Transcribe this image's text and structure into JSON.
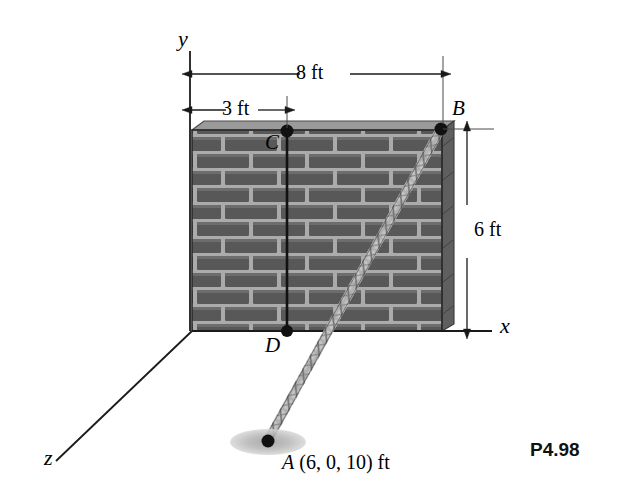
{
  "figure": {
    "problem_label": "P4.98",
    "axes": [
      {
        "name": "y-axis",
        "label": "y"
      },
      {
        "name": "x-axis",
        "label": "x"
      },
      {
        "name": "z-axis",
        "label": "z"
      }
    ],
    "points": [
      {
        "id": "B",
        "label": "B",
        "description": "cable anchor at top right corner of wall"
      },
      {
        "id": "C",
        "label": "C",
        "description": "point on top edge of wall, 3 ft from y-axis"
      },
      {
        "id": "D",
        "label": "D",
        "description": "point at base of wall below C"
      },
      {
        "id": "A",
        "label": "A",
        "coords_text": "(6, 0, 10) ft",
        "description": "cable end on ground"
      }
    ],
    "dimensions": [
      {
        "name": "wall-width",
        "label": "8 ft",
        "orientation": "horizontal"
      },
      {
        "name": "c-offset",
        "label": "3 ft",
        "orientation": "horizontal"
      },
      {
        "name": "wall-height",
        "label": "6 ft",
        "orientation": "vertical"
      }
    ],
    "objects": [
      {
        "name": "brick-wall",
        "description": "masonry wall shown in perspective"
      },
      {
        "name": "cable",
        "description": "twisted rope from B to A"
      },
      {
        "name": "ground-shadow",
        "description": "elliptical shadow at point A"
      }
    ],
    "colors": {
      "brick": "#595959",
      "mortar": "#b0b0b0",
      "wall_cap": "#8f8f8f",
      "line": "#1a1a1a",
      "rope_light": "#e8e8e8",
      "rope_dark": "#6b6b6b",
      "shadow": "#b8b8b8"
    }
  }
}
